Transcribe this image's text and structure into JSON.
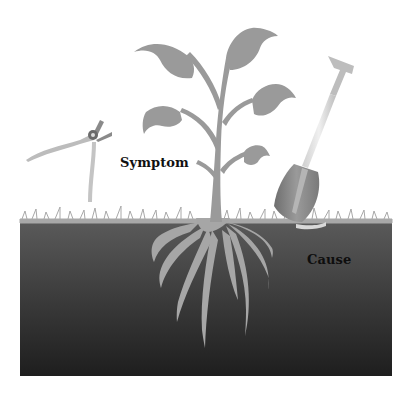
{
  "diagram": {
    "labels": {
      "symptom": "Symptom",
      "cause": "Cause"
    },
    "elements": [
      {
        "name": "pruning-shears",
        "meaning": "treating symptom"
      },
      {
        "name": "plant",
        "meaning": "visible problem"
      },
      {
        "name": "shovel",
        "meaning": "digging to cause"
      },
      {
        "name": "roots",
        "meaning": "underlying cause"
      },
      {
        "name": "soil",
        "meaning": "hidden layer"
      }
    ],
    "colors": {
      "plant": "#9a9a9a",
      "soil_top": "#5a5a5a",
      "soil_bottom": "#1e1e1e",
      "grass": "#a8a8a8",
      "label_text": "#111111"
    }
  }
}
